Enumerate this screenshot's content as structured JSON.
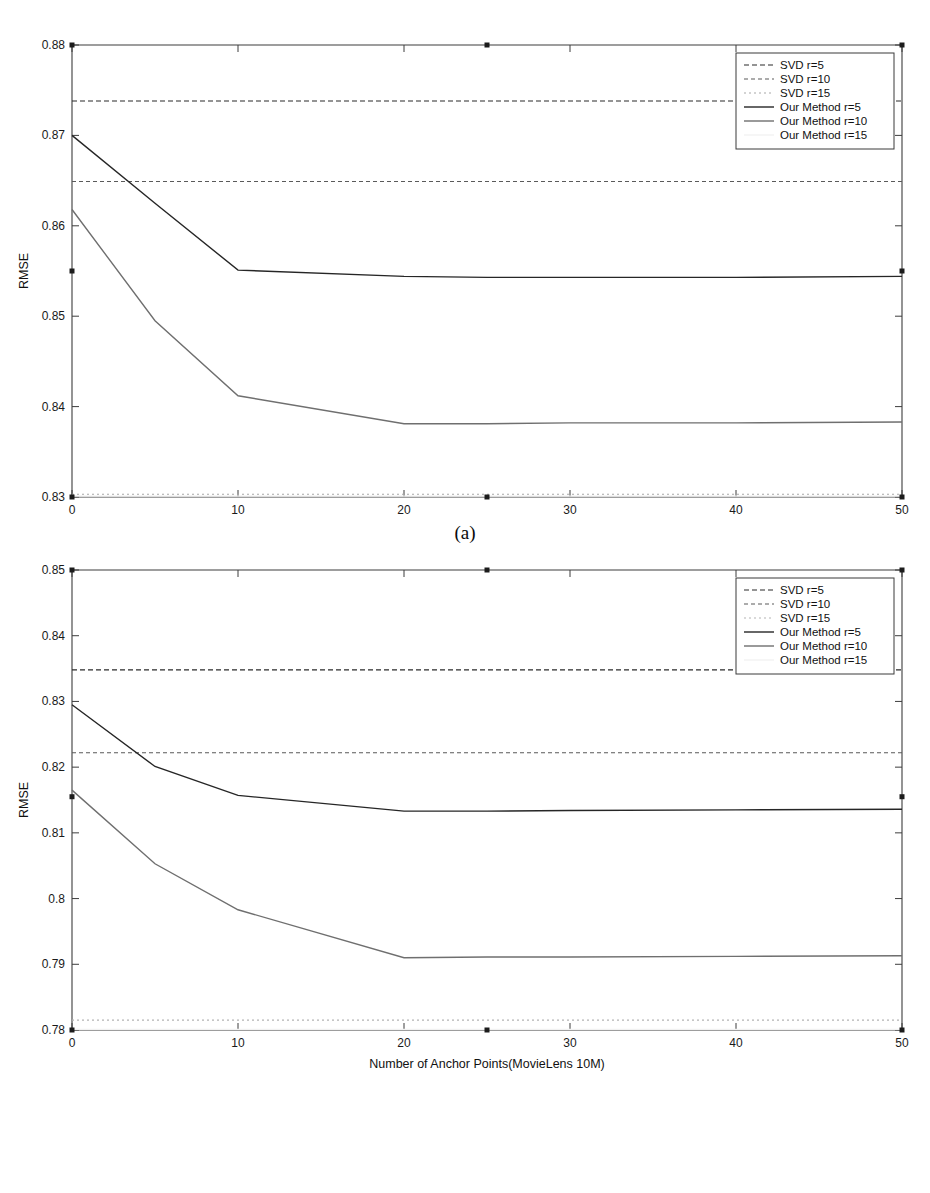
{
  "figure": {
    "caption_a": "(a)",
    "caption_b": "(b)"
  },
  "chart_data": [
    {
      "id": "chart-a",
      "type": "line",
      "title": "",
      "xlabel": "Number of Anchor Points(MovieLens 1M)",
      "ylabel": "RMSE",
      "xlim": [
        0,
        50
      ],
      "ylim": [
        0.83,
        0.88
      ],
      "xticks": [
        0,
        10,
        20,
        30,
        40,
        50
      ],
      "xticklabels": [
        "0",
        "10",
        "20",
        "30",
        "40",
        "50"
      ],
      "yticks": [
        0.83,
        0.84,
        0.85,
        0.86,
        0.87,
        0.88
      ],
      "yticklabels": [
        "0.83",
        "0.84",
        "0.85",
        "0.86",
        "0.87",
        "0.88"
      ],
      "grid": false,
      "legend_position": "top-right",
      "series": [
        {
          "name": "SVD r=5",
          "style": "dashed",
          "color": "#2b2b2b",
          "x": [
            0,
            50
          ],
          "values": [
            0.8738,
            0.8738
          ]
        },
        {
          "name": "SVD r=10",
          "style": "dashed",
          "color": "#5a5a5a",
          "x": [
            0,
            50
          ],
          "values": [
            0.8649,
            0.8649
          ]
        },
        {
          "name": "SVD r=15",
          "style": "dashed",
          "color": "#a8a8a8",
          "x": [
            0,
            50
          ],
          "values": [
            0.8303,
            0.8303
          ]
        },
        {
          "name": "Our Method r=5",
          "style": "solid",
          "color": "#262626",
          "x": [
            0,
            5,
            10,
            20,
            25,
            30,
            40,
            50
          ],
          "values": [
            0.87,
            0.8625,
            0.8551,
            0.8544,
            0.8543,
            0.8543,
            0.8543,
            0.8544
          ]
        },
        {
          "name": "Our Method r=10",
          "style": "solid",
          "color": "#6f6f6f",
          "x": [
            0,
            5,
            10,
            20,
            25,
            30,
            40,
            50
          ],
          "values": [
            0.8618,
            0.8495,
            0.8412,
            0.8381,
            0.8381,
            0.8382,
            0.8382,
            0.8383
          ]
        },
        {
          "name": "Our Method r=15",
          "style": "solid",
          "color": "#f2f2f2",
          "x": [
            0,
            50
          ],
          "values": [
            0.8301,
            0.8301
          ]
        }
      ],
      "markers": [
        {
          "x": 0,
          "y": 0.88
        },
        {
          "x": 25,
          "y": 0.88
        },
        {
          "x": 50,
          "y": 0.88
        },
        {
          "x": 0,
          "y": 0.855
        },
        {
          "x": 50,
          "y": 0.855
        },
        {
          "x": 0,
          "y": 0.83
        },
        {
          "x": 25,
          "y": 0.83
        },
        {
          "x": 50,
          "y": 0.83
        }
      ]
    },
    {
      "id": "chart-b",
      "type": "line",
      "title": "",
      "xlabel": "Number of Anchor Points(MovieLens 10M)",
      "ylabel": "RMSE",
      "xlim": [
        0,
        50
      ],
      "ylim": [
        0.78,
        0.85
      ],
      "xticks": [
        0,
        10,
        20,
        30,
        40,
        50
      ],
      "xticklabels": [
        "0",
        "10",
        "20",
        "30",
        "40",
        "50"
      ],
      "yticks": [
        0.78,
        0.79,
        0.8,
        0.81,
        0.82,
        0.83,
        0.84,
        0.85
      ],
      "yticklabels": [
        "0.78",
        "0.79",
        "0.8",
        "0.81",
        "0.82",
        "0.83",
        "0.84",
        "0.85"
      ],
      "grid": false,
      "legend_position": "top-right",
      "series": [
        {
          "name": "SVD r=5",
          "style": "dashed",
          "color": "#2b2b2b",
          "x": [
            0,
            50
          ],
          "values": [
            0.8348,
            0.8348
          ]
        },
        {
          "name": "SVD r=10",
          "style": "dashed",
          "color": "#5a5a5a",
          "x": [
            0,
            50
          ],
          "values": [
            0.8222,
            0.8222
          ]
        },
        {
          "name": "SVD r=15",
          "style": "dashed",
          "color": "#b4b4b4",
          "x": [
            0,
            50
          ],
          "values": [
            0.7815,
            0.7815
          ]
        },
        {
          "name": "Our Method r=5",
          "style": "solid",
          "color": "#262626",
          "x": [
            0,
            5,
            10,
            20,
            25,
            30,
            40,
            50
          ],
          "values": [
            0.8295,
            0.8201,
            0.8157,
            0.8133,
            0.8133,
            0.8134,
            0.8135,
            0.8136
          ]
        },
        {
          "name": "Our Method r=10",
          "style": "solid",
          "color": "#6f6f6f",
          "x": [
            0,
            5,
            10,
            20,
            25,
            30,
            40,
            50
          ],
          "values": [
            0.8165,
            0.8053,
            0.7983,
            0.791,
            0.7911,
            0.7911,
            0.7912,
            0.7913
          ]
        },
        {
          "name": "Our Method r=15",
          "style": "solid",
          "color": "#f2f2f2",
          "x": [
            0,
            50
          ],
          "values": [
            0.7801,
            0.7801
          ]
        }
      ],
      "markers": [
        {
          "x": 0,
          "y": 0.85
        },
        {
          "x": 25,
          "y": 0.85
        },
        {
          "x": 50,
          "y": 0.85
        },
        {
          "x": 0,
          "y": 0.8155
        },
        {
          "x": 50,
          "y": 0.8155
        },
        {
          "x": 0,
          "y": 0.78
        },
        {
          "x": 25,
          "y": 0.78
        },
        {
          "x": 50,
          "y": 0.78
        }
      ]
    }
  ]
}
